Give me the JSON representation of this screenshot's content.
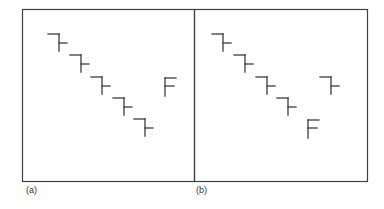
{
  "figure": {
    "stroke_color": "#3c3c3c",
    "frame_color": "#404040",
    "panels": [
      {
        "id": "a",
        "label": "(a)",
        "frame": {
          "x": 22,
          "y": 9,
          "width": 172,
          "height": 172
        },
        "stair_glyphs": [
          {
            "x": 48,
            "y": 34
          },
          {
            "x": 70,
            "y": 55
          },
          {
            "x": 91,
            "y": 77
          },
          {
            "x": 113,
            "y": 98
          },
          {
            "x": 134,
            "y": 119
          }
        ],
        "f_glyphs": [
          {
            "x": 165,
            "y": 78
          }
        ]
      },
      {
        "id": "b",
        "label": "(b)",
        "frame": {
          "x": 194,
          "y": 9,
          "width": 173,
          "height": 172
        },
        "stair_glyphs": [
          {
            "x": 212,
            "y": 34
          },
          {
            "x": 234,
            "y": 55
          },
          {
            "x": 256,
            "y": 77
          },
          {
            "x": 277,
            "y": 98
          },
          {
            "x": 320,
            "y": 77
          }
        ],
        "f_glyphs": [
          {
            "x": 308,
            "y": 120
          }
        ]
      }
    ]
  }
}
